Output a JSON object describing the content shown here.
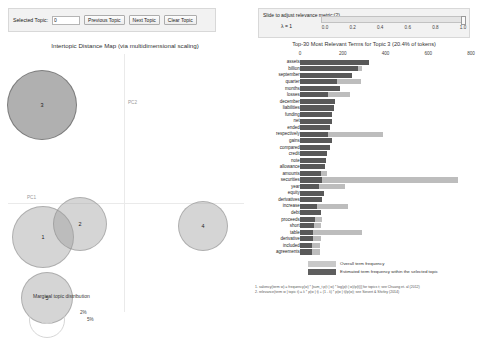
{
  "controls": {
    "selected_topic_label": "Selected Topic:",
    "selected_topic_value": "0",
    "previous_topic_label": "Previous Topic",
    "next_topic_label": "Next Topic",
    "clear_topic_label": "Clear Topic"
  },
  "slider": {
    "label": "Slide to adjust relevance metric:(2)",
    "lambda_label": "λ = 1",
    "value": 1.0,
    "ticks": [
      "0.0",
      "0.2",
      "0.4",
      "0.6",
      "0.8",
      "1.0"
    ]
  },
  "intertopic_map": {
    "title": "Intertopic Distance Map (via multidimensional scaling)",
    "xaxis_label": "PC1",
    "yaxis_label": "PC2",
    "marginal_legend_title": "Marginal topic distribution",
    "reference_circles": [
      {
        "label": "2%",
        "diameter_px": 22
      },
      {
        "label": "5%",
        "diameter_px": 36
      }
    ],
    "topics": [
      {
        "id": "1",
        "cx": 43,
        "cy": 197,
        "r": 31,
        "selected": false
      },
      {
        "id": "2",
        "cx": 80,
        "cy": 184,
        "r": 27,
        "selected": false
      },
      {
        "id": "3",
        "cx": 42,
        "cy": 65,
        "r": 35,
        "selected": true
      },
      {
        "id": "4",
        "cx": 203,
        "cy": 186,
        "r": 25,
        "selected": false
      },
      {
        "id": "5",
        "cx": 47,
        "cy": 258,
        "r": 26,
        "selected": false
      }
    ]
  },
  "chart_data": {
    "type": "bar",
    "title": "Top-30 Most Relevant Terms for Topic 3 (20.4% of tokens)",
    "orientation": "horizontal",
    "xlabel": "",
    "ylabel": "",
    "xlim": [
      0,
      800
    ],
    "xticks": [
      0,
      200,
      400,
      600,
      800
    ],
    "grid": false,
    "legend_position": "bottom-left",
    "series": [
      {
        "name": "Overall term frequency",
        "color": "#bdbdbd"
      },
      {
        "name": "Estimated term frequency within the selected topic",
        "color": "#595959"
      }
    ],
    "categories": [
      "assets",
      "billion",
      "september",
      "quarter",
      "months",
      "losses",
      "december",
      "liabilities",
      "funding",
      "net",
      "ended",
      "respectively",
      "gains",
      "compared",
      "credit",
      "note",
      "allowance",
      "amounts",
      "securities",
      "year",
      "equity",
      "derivatives",
      "increase",
      "debt",
      "proceeds",
      "short",
      "table",
      "derivative",
      "included",
      "agreements"
    ],
    "overall_values": [
      322,
      288,
      243,
      287,
      186,
      235,
      166,
      159,
      150,
      148,
      140,
      390,
      152,
      139,
      128,
      120,
      115,
      128,
      740,
      210,
      112,
      105,
      225,
      96,
      103,
      100,
      290,
      97,
      95,
      93
    ],
    "topic_values": [
      322,
      272,
      243,
      175,
      186,
      133,
      166,
      159,
      150,
      148,
      140,
      130,
      152,
      139,
      128,
      120,
      115,
      96,
      105,
      90,
      112,
      105,
      78,
      96,
      68,
      64,
      62,
      60,
      58,
      56
    ],
    "legend": [
      "Overall term frequency",
      "Estimated term frequency within the selected topic"
    ]
  },
  "footnotes": [
    "1. saliency(term w) = frequency(w) * [sum_t p(t | w) * log(p(t | w)/p(t))] for topics t; see Chuang et. al (2012)",
    "2. relevance(term w | topic t) = λ * p(w | t) + (1 - λ) * p(w | t)/p(w); see Sievert & Shirley (2014)"
  ]
}
